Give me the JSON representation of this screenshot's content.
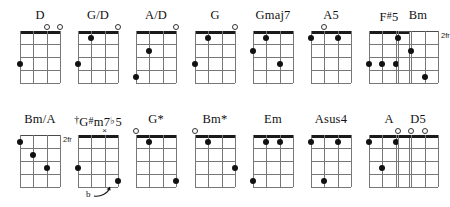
{
  "doc": {
    "type": "chord-diagram-chart",
    "instrument_strings": 4,
    "frets_shown": 4
  },
  "chart_data": {
    "type": "table",
    "title": "",
    "rows": 2,
    "columns": 8,
    "chords": [
      {
        "name": "D",
        "name_html": "D",
        "row": 0,
        "col": 0,
        "position_label": "",
        "nut": "thick",
        "open_strings": [
          3,
          4
        ],
        "muted_strings": [],
        "dots": [
          {
            "string": 1,
            "fret": 3
          }
        ]
      },
      {
        "name": "G/D",
        "name_html": "G/D",
        "row": 0,
        "col": 1,
        "position_label": "",
        "nut": "thick",
        "open_strings": [
          4
        ],
        "muted_strings": [],
        "dots": [
          {
            "string": 2,
            "fret": 1
          },
          {
            "string": 1,
            "fret": 3
          }
        ]
      },
      {
        "name": "A/D",
        "name_html": "A/D",
        "row": 0,
        "col": 2,
        "position_label": "",
        "nut": "thick",
        "open_strings": [
          4
        ],
        "muted_strings": [],
        "dots": [
          {
            "string": 2,
            "fret": 2
          },
          {
            "string": 1,
            "fret": 4
          }
        ]
      },
      {
        "name": "G",
        "name_html": "G",
        "row": 0,
        "col": 3,
        "position_label": "",
        "nut": "thick",
        "open_strings": [
          4
        ],
        "muted_strings": [],
        "dots": [
          {
            "string": 2,
            "fret": 1
          },
          {
            "string": 1,
            "fret": 3
          }
        ]
      },
      {
        "name": "Gmaj7",
        "name_html": "Gmaj7",
        "row": 0,
        "col": 4,
        "position_label": "",
        "nut": "thick",
        "open_strings": [],
        "muted_strings": [],
        "dots": [
          {
            "string": 2,
            "fret": 1
          },
          {
            "string": 1,
            "fret": 2
          },
          {
            "string": 3,
            "fret": 3
          }
        ]
      },
      {
        "name": "A5",
        "name_html": "A5",
        "row": 0,
        "col": 5,
        "position_label": "",
        "nut": "thick",
        "open_strings": [
          2
        ],
        "muted_strings": [],
        "dots": [
          {
            "string": 1,
            "fret": 1
          },
          {
            "string": 3,
            "fret": 1
          }
        ]
      },
      {
        "name": "F#5",
        "name_html": "F<span class=\"sup\">#</span>5",
        "row": 0,
        "col": 6,
        "position_label": "",
        "nut": "thick",
        "open_strings": [],
        "muted_strings": [],
        "dots": [
          {
            "string": 1,
            "fret": 3
          },
          {
            "string": 2,
            "fret": 3
          },
          {
            "string": 3,
            "fret": 3
          }
        ]
      },
      {
        "name": "Bm",
        "name_html": "Bm",
        "row": 0,
        "col": 7,
        "position_label": "2fr",
        "nut": "thin",
        "open_strings": [],
        "muted_strings": [],
        "dots": [
          {
            "string": 1,
            "fret": 1
          },
          {
            "string": 2,
            "fret": 2
          },
          {
            "string": 3,
            "fret": 4
          }
        ]
      },
      {
        "name": "Bm/A",
        "name_html": "Bm/A",
        "row": 1,
        "col": 0,
        "position_label": "2fr",
        "nut": "thin",
        "open_strings": [],
        "muted_strings": [],
        "dots": [
          {
            "string": 1,
            "fret": 1
          },
          {
            "string": 2,
            "fret": 2
          },
          {
            "string": 3,
            "fret": 3
          }
        ]
      },
      {
        "name": "G#m7b5",
        "name_html": "<span class=\"dag\">&dagger;</span>G<span class=\"sup\">#</span>m7<span class=\"sup\">&#9837;</span>5",
        "row": 1,
        "col": 1,
        "position_label": "",
        "nut": "thick",
        "open_strings": [],
        "muted_strings": [
          3
        ],
        "dots": [
          {
            "string": 1,
            "fret": 3
          },
          {
            "string": 4,
            "fret": 4
          }
        ],
        "annotation": {
          "text": "b",
          "target_string": 4,
          "target_fret": 4
        }
      },
      {
        "name": "G*",
        "name_html": "G*",
        "row": 1,
        "col": 2,
        "position_label": "",
        "nut": "thick",
        "open_strings": [
          1
        ],
        "muted_strings": [],
        "dots": [
          {
            "string": 2,
            "fret": 1
          },
          {
            "string": 4,
            "fret": 4
          }
        ]
      },
      {
        "name": "Bm*",
        "name_html": "Bm*",
        "row": 1,
        "col": 3,
        "position_label": "",
        "nut": "thick",
        "open_strings": [
          1
        ],
        "muted_strings": [],
        "dots": [
          {
            "string": 2,
            "fret": 1
          },
          {
            "string": 4,
            "fret": 3
          }
        ]
      },
      {
        "name": "Em",
        "name_html": "Em",
        "row": 1,
        "col": 4,
        "position_label": "",
        "nut": "thick",
        "open_strings": [],
        "muted_strings": [],
        "dots": [
          {
            "string": 2,
            "fret": 1
          },
          {
            "string": 3,
            "fret": 1
          },
          {
            "string": 1,
            "fret": 4
          }
        ]
      },
      {
        "name": "Asus4",
        "name_html": "Asus4",
        "row": 1,
        "col": 5,
        "position_label": "",
        "nut": "thick",
        "open_strings": [],
        "muted_strings": [],
        "dots": [
          {
            "string": 1,
            "fret": 1
          },
          {
            "string": 3,
            "fret": 1
          },
          {
            "string": 2,
            "fret": 4
          }
        ]
      },
      {
        "name": "A",
        "name_html": "A",
        "row": 1,
        "col": 6,
        "position_label": "",
        "nut": "thick",
        "open_strings": [],
        "muted_strings": [],
        "dots": [
          {
            "string": 1,
            "fret": 1
          },
          {
            "string": 3,
            "fret": 1
          },
          {
            "string": 2,
            "fret": 3
          }
        ]
      },
      {
        "name": "D5",
        "name_html": "D5",
        "row": 1,
        "col": 7,
        "position_label": "",
        "nut": "thick",
        "open_strings": [
          1,
          2,
          3
        ],
        "muted_strings": [],
        "dots": []
      }
    ]
  },
  "colors": {
    "ink": "#111111",
    "grid": "#777777",
    "nut": "#1a1a1a",
    "background": "#ffffff"
  }
}
